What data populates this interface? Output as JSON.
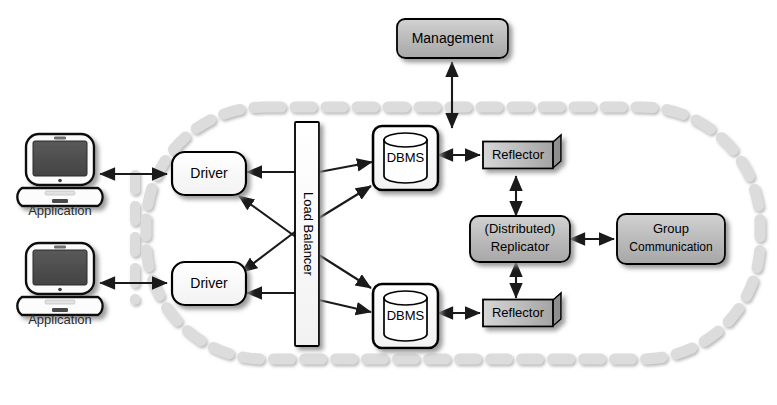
{
  "diagram": {
    "type": "architecture-block-diagram",
    "colors": {
      "background": "#ffffff",
      "boundary_dash": "#d9d9d9",
      "node_fill_white": "#fdfdfd",
      "node_fill_gray": "#b9b9b9",
      "node_fill_gray_light": "#c8c8c8",
      "node_stroke": "#000000",
      "arrow": "#1a1a1a",
      "shadow": "#9a9a9a",
      "laptop_screen": "#4d4d4d"
    },
    "boundary": {
      "name": "replicated-system-boundary",
      "style": "dashed-rounded-rectangle",
      "label": ""
    },
    "nodes": [
      {
        "id": "management",
        "label": "Management",
        "shape": "rounded-rect",
        "fill": "gray"
      },
      {
        "id": "app-top",
        "label": "Application",
        "shape": "laptop-icon",
        "fill": "white"
      },
      {
        "id": "app-bottom",
        "label": "Application",
        "shape": "laptop-icon",
        "fill": "white"
      },
      {
        "id": "driver-top",
        "label": "Driver",
        "shape": "rounded-rect",
        "fill": "white"
      },
      {
        "id": "driver-bottom",
        "label": "Driver",
        "shape": "rounded-rect",
        "fill": "white"
      },
      {
        "id": "load-balancer",
        "label": "Load Balancer",
        "shape": "vertical-bar",
        "fill": "white"
      },
      {
        "id": "dbms-top",
        "label": "DBMS",
        "shape": "db-cylinder",
        "fill": "white"
      },
      {
        "id": "dbms-bottom",
        "label": "DBMS",
        "shape": "db-cylinder",
        "fill": "white"
      },
      {
        "id": "reflector-top",
        "label": "Reflector",
        "shape": "box-3d",
        "fill": "gray"
      },
      {
        "id": "reflector-bottom",
        "label": "Reflector",
        "shape": "box-3d",
        "fill": "gray"
      },
      {
        "id": "replicator",
        "label": "(Distributed)\nReplicator",
        "shape": "rounded-rect",
        "fill": "gray"
      },
      {
        "id": "group-comm",
        "label": "Group\nCommunication",
        "shape": "rounded-rect",
        "fill": "gray"
      }
    ],
    "node_text": {
      "management": "Management",
      "application_top": "Application",
      "application_bottom": "Application",
      "driver_top": "Driver",
      "driver_bottom": "Driver",
      "load_balancer": "Load Balancer",
      "dbms_top": "DBMS",
      "dbms_bottom": "DBMS",
      "reflector_top": "Reflector",
      "reflector_bottom": "Reflector",
      "replicator_line1": "(Distributed)",
      "replicator_line2": "Replicator",
      "group_comm_line1": "Group",
      "group_comm_line2": "Communication"
    },
    "edges": [
      {
        "from": "app-top",
        "to": "driver-top",
        "arrow": "double"
      },
      {
        "from": "app-bottom",
        "to": "driver-bottom",
        "arrow": "double"
      },
      {
        "from": "load-balancer",
        "to": "driver-top",
        "arrow": "single"
      },
      {
        "from": "load-balancer",
        "to": "driver-bottom",
        "arrow": "single"
      },
      {
        "from": "load-balancer",
        "to": "driver-top",
        "arrow": "single",
        "note": "diagonal cross from lower port"
      },
      {
        "from": "load-balancer",
        "to": "driver-bottom",
        "arrow": "single",
        "note": "diagonal cross from upper port"
      },
      {
        "from": "load-balancer",
        "to": "dbms-top",
        "arrow": "single"
      },
      {
        "from": "load-balancer",
        "to": "dbms-top",
        "arrow": "single",
        "note": "second diagonal"
      },
      {
        "from": "load-balancer",
        "to": "dbms-bottom",
        "arrow": "single"
      },
      {
        "from": "load-balancer",
        "to": "dbms-bottom",
        "arrow": "single",
        "note": "second diagonal"
      },
      {
        "from": "dbms-top",
        "to": "reflector-top",
        "arrow": "double"
      },
      {
        "from": "dbms-bottom",
        "to": "reflector-bottom",
        "arrow": "double"
      },
      {
        "from": "reflector-top",
        "to": "replicator",
        "arrow": "double"
      },
      {
        "from": "reflector-bottom",
        "to": "replicator",
        "arrow": "double"
      },
      {
        "from": "replicator",
        "to": "group-comm",
        "arrow": "double"
      },
      {
        "from": "management",
        "to": "dbms-top",
        "arrow": "double"
      }
    ]
  }
}
